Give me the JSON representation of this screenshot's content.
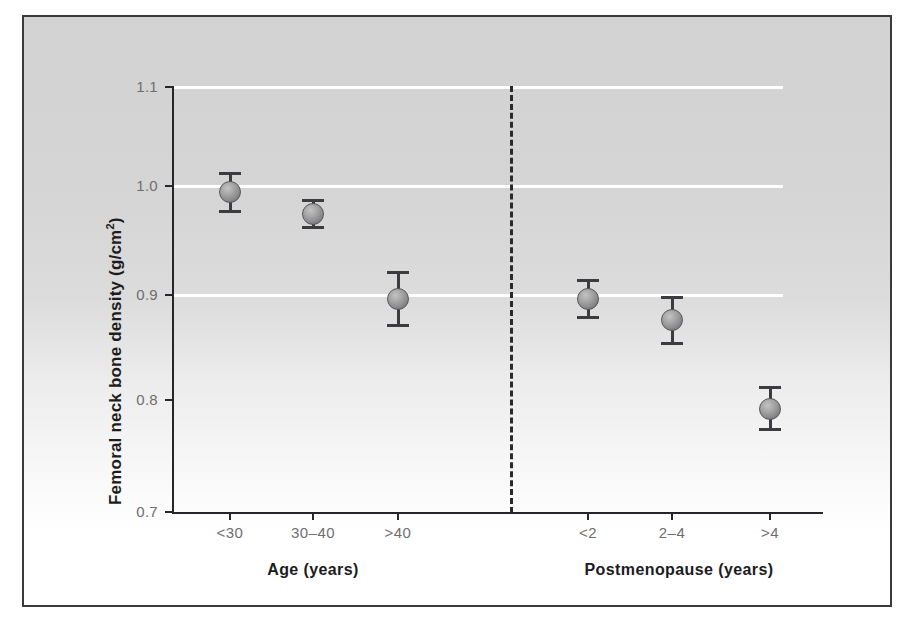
{
  "chart_data": {
    "type": "scatter",
    "title": "",
    "xlabel": "",
    "ylabel": "Femoral neck bone density (g/cm²)",
    "ylabel_text": "Femoral neck bone density (g/cm",
    "ylabel_sup": "2",
    "ylabel_tail": ")",
    "ylim": [
      0.7,
      1.1
    ],
    "yticks": [
      "1.1",
      "1.0",
      "0.9",
      "0.8",
      "0.7"
    ],
    "ytick_values": [
      1.1,
      1.0,
      0.9,
      0.8,
      0.7
    ],
    "grid": "horizontal white gridlines at 1.1, 1.0 and 0.9",
    "gridline_values": [
      1.1,
      1.0,
      0.9
    ],
    "legend": "none",
    "categories": [
      "<30",
      "30–40",
      ">40",
      "<2",
      "2–4",
      ">4"
    ],
    "values": [
      1.0,
      0.98,
      0.9,
      0.9,
      0.88,
      0.797
    ],
    "errors": [
      0.018,
      0.013,
      0.025,
      0.018,
      0.022,
      0.02
    ],
    "groups": [
      {
        "label": "Age (years)",
        "categories": [
          "<30",
          "30–40",
          ">40"
        ],
        "values": [
          1.0,
          0.98,
          0.9
        ],
        "errors": [
          0.018,
          0.013,
          0.025
        ]
      },
      {
        "label": "Postmenopause (years)",
        "categories": [
          "<2",
          "2–4",
          ">4"
        ],
        "values": [
          0.9,
          0.88,
          0.797
        ],
        "errors": [
          0.018,
          0.022,
          0.02
        ]
      }
    ],
    "annotations": [
      "dashed vertical divider separating the Age and Postmenopause groups"
    ],
    "marker_color": "#8d8d8f",
    "errorbar_color": "#3c3c40",
    "gridline_color": "#ffffff",
    "axis_color": "#26262a",
    "plot_background": "#d2d2d2"
  },
  "axis": {
    "ytitle_main": "Femoral neck bone density (g/cm",
    "ytitle_sup": "2",
    "ytitle_end": ")"
  },
  "yticks": [
    {
      "label": "1.1"
    },
    {
      "label": "1.0"
    },
    {
      "label": "0.9"
    },
    {
      "label": "0.8"
    },
    {
      "label": "0.7"
    }
  ],
  "xticks": [
    {
      "label": "<30"
    },
    {
      "label": "30–40"
    },
    {
      "label": ">40"
    },
    {
      "label": "<2"
    },
    {
      "label": "2–4"
    },
    {
      "label": ">4"
    }
  ],
  "groups": [
    {
      "label": "Age (years)"
    },
    {
      "label": "Postmenopause (years)"
    }
  ]
}
